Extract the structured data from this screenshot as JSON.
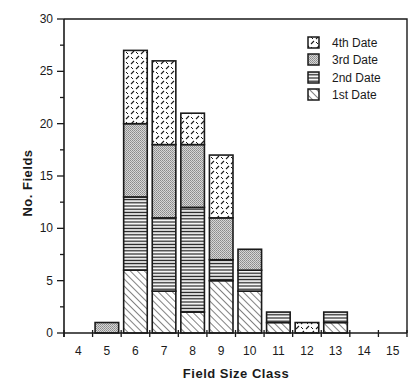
{
  "chart_data": {
    "type": "bar",
    "stacked": true,
    "title": "",
    "xlabel": "Field Size Class",
    "ylabel": "No. Fields",
    "ylim": [
      0,
      30
    ],
    "yticks": [
      0,
      5,
      10,
      15,
      20,
      25,
      30
    ],
    "yminor_step": 2.5,
    "categories": [
      "4",
      "5",
      "6",
      "7",
      "8",
      "9",
      "10",
      "11",
      "12",
      "13",
      "14",
      "15"
    ],
    "series": [
      {
        "name": "1st Date",
        "pattern": "diagonal-hatch",
        "values": [
          0,
          0,
          6,
          4,
          2,
          5,
          4,
          1,
          0,
          1,
          0,
          0
        ]
      },
      {
        "name": "2nd Date",
        "pattern": "horizontal-lines",
        "values": [
          0,
          0,
          7,
          7,
          10,
          2,
          2,
          1,
          0,
          1,
          0,
          0
        ]
      },
      {
        "name": "3rd Date",
        "pattern": "dotted-gray",
        "values": [
          0,
          1,
          7,
          7,
          6,
          4,
          2,
          0,
          0,
          0,
          0,
          0
        ]
      },
      {
        "name": "4th Date",
        "pattern": "dashed-check",
        "values": [
          0,
          0,
          7,
          8,
          3,
          6,
          0,
          0,
          1,
          0,
          0,
          0
        ]
      }
    ],
    "totals": [
      0,
      1,
      27,
      26,
      21,
      17,
      8,
      2,
      1,
      2,
      0,
      0
    ],
    "legend": {
      "position": "upper-right",
      "entries": [
        "4th Date",
        "3rd Date",
        "2nd Date",
        "1st Date"
      ]
    },
    "grid": false,
    "colors": {
      "ink": "#1a1a1a",
      "background": "#ffffff",
      "dot_fill": "#bdbdbd"
    }
  },
  "axes": {
    "x_title": "Field Size Class",
    "y_title": "No. Fields"
  }
}
